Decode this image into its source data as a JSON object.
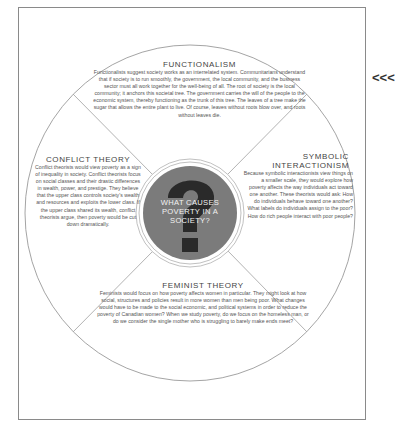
{
  "diagram": {
    "center": {
      "question": "WHAT CAUSES POVERTY IN A SOCIETY?",
      "icon": "question-mark-icon",
      "disc_color": "#7b7b7b",
      "glyph_color": "#2a2a2a"
    },
    "sections": {
      "functionalism": {
        "title": "FUNCTIONALISM",
        "body": "Functionalists suggest society works as an interrelated system. Communitarians understand that if society is to run smoothly, the government, the local community, and the business sector must all work together for the well-being of all. The root of society is the local community; it anchors this societal tree. The government carries the will of the people to the economic system, thereby functioning as the trunk of this tree. The leaves of a tree make the sugar that allows the entire plant to live. Of course, leaves without roots blow over, and roots without leaves die."
      },
      "conflict": {
        "title": "CONFLICT THEORY",
        "body": "Conflict theorists would view poverty as a sign of inequality in society. Conflict theorists focus on social classes and their drastic differences in wealth, power, and prestige. They believe that the upper class controls society's wealth and resources and exploits the lower class. If the upper class shared its wealth, conflict theorists argue, then poverty would be cut down dramatically."
      },
      "symbolic": {
        "title_line1": "SYMBOLIC",
        "title_line2": "INTERACTIONISM",
        "body": "Because symbolic interactionists view things on a smaller scale, they would explore how poverty affects the way individuals act toward one another. These theorists would ask: How do individuals behave toward one another? What labels do individuals assign to the poor? How do rich people interact with poor people?"
      },
      "feminist": {
        "title": "FEMINIST THEORY",
        "body": "Feminists would focus on how poverty affects women in particular. They might look at how social, structures and policies result in more women than men being poor. What changes would have to be made to the social economic, and political systems in order to reduce the poverty of Canadian women? When we study poverty, do we focus on the homeless man, or do we consider the single mother who is struggling to barely make ends meet?"
      }
    },
    "pointer": "<<<"
  }
}
